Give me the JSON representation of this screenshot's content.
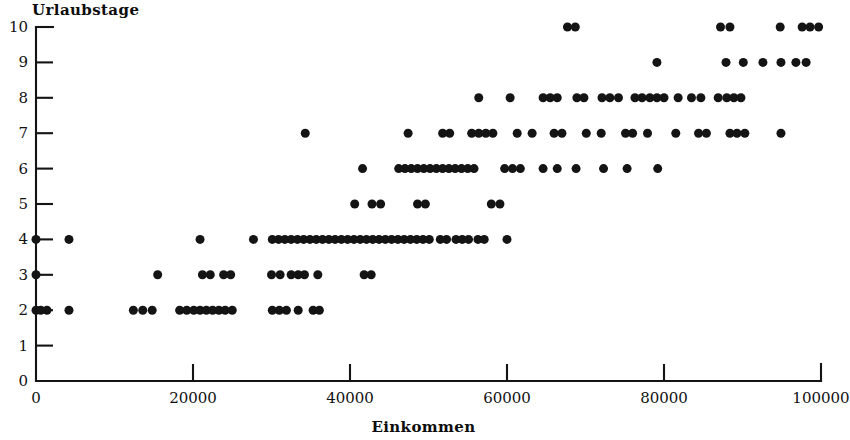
{
  "chart_data": {
    "type": "scatter",
    "title": "",
    "xlabel": "Einkommen",
    "ylabel": "Urlaubstage",
    "xlim": [
      0,
      100000
    ],
    "ylim": [
      0,
      10
    ],
    "grid": false,
    "legend": null,
    "marker": {
      "shape": "circle",
      "color": "#141414",
      "size_px": 9
    },
    "xticks": [
      0,
      20000,
      40000,
      60000,
      80000,
      100000
    ],
    "xtick_labels": [
      "0",
      "20000",
      "40000",
      "60000",
      "80000",
      "100000"
    ],
    "yticks": [
      0,
      1,
      2,
      3,
      4,
      5,
      6,
      7,
      8,
      9,
      10
    ],
    "ytick_labels": [
      "0",
      "1",
      "2",
      "3",
      "4",
      "5",
      "6",
      "7",
      "8",
      "9",
      "10"
    ],
    "series": [
      {
        "name": "Beobachtungen",
        "points": [
          [
            0,
            2
          ],
          [
            600,
            2
          ],
          [
            1400,
            2
          ],
          [
            4200,
            2
          ],
          [
            12400,
            2
          ],
          [
            13600,
            2
          ],
          [
            14800,
            2
          ],
          [
            18300,
            2
          ],
          [
            19200,
            2
          ],
          [
            20100,
            2
          ],
          [
            20900,
            2
          ],
          [
            21700,
            2
          ],
          [
            22500,
            2
          ],
          [
            23300,
            2
          ],
          [
            24100,
            2
          ],
          [
            25000,
            2
          ],
          [
            30100,
            2
          ],
          [
            31000,
            2
          ],
          [
            31900,
            2
          ],
          [
            33400,
            2
          ],
          [
            35300,
            2
          ],
          [
            36100,
            2
          ],
          [
            0,
            3
          ],
          [
            15500,
            3
          ],
          [
            21200,
            3
          ],
          [
            22200,
            3
          ],
          [
            23900,
            3
          ],
          [
            24800,
            3
          ],
          [
            30000,
            3
          ],
          [
            31100,
            3
          ],
          [
            32500,
            3
          ],
          [
            33400,
            3
          ],
          [
            34200,
            3
          ],
          [
            35900,
            3
          ],
          [
            41800,
            3
          ],
          [
            42700,
            3
          ],
          [
            0,
            4
          ],
          [
            4200,
            4
          ],
          [
            20900,
            4
          ],
          [
            27700,
            4
          ],
          [
            30100,
            4
          ],
          [
            30900,
            4
          ],
          [
            31700,
            4
          ],
          [
            32500,
            4
          ],
          [
            33300,
            4
          ],
          [
            34100,
            4
          ],
          [
            34900,
            4
          ],
          [
            35700,
            4
          ],
          [
            36500,
            4
          ],
          [
            37300,
            4
          ],
          [
            38100,
            4
          ],
          [
            38900,
            4
          ],
          [
            39700,
            4
          ],
          [
            40500,
            4
          ],
          [
            41300,
            4
          ],
          [
            42100,
            4
          ],
          [
            42900,
            4
          ],
          [
            43700,
            4
          ],
          [
            44500,
            4
          ],
          [
            45300,
            4
          ],
          [
            46100,
            4
          ],
          [
            46900,
            4
          ],
          [
            47700,
            4
          ],
          [
            48500,
            4
          ],
          [
            49300,
            4
          ],
          [
            50100,
            4
          ],
          [
            51500,
            4
          ],
          [
            52300,
            4
          ],
          [
            53500,
            4
          ],
          [
            54300,
            4
          ],
          [
            55100,
            4
          ],
          [
            56300,
            4
          ],
          [
            57100,
            4
          ],
          [
            60000,
            4
          ],
          [
            40600,
            5
          ],
          [
            42800,
            5
          ],
          [
            43900,
            5
          ],
          [
            48600,
            5
          ],
          [
            49600,
            5
          ],
          [
            58000,
            5
          ],
          [
            59100,
            5
          ],
          [
            41600,
            6
          ],
          [
            46200,
            6
          ],
          [
            47000,
            6
          ],
          [
            47800,
            6
          ],
          [
            48600,
            6
          ],
          [
            49400,
            6
          ],
          [
            50200,
            6
          ],
          [
            51000,
            6
          ],
          [
            51800,
            6
          ],
          [
            52600,
            6
          ],
          [
            53400,
            6
          ],
          [
            54200,
            6
          ],
          [
            55000,
            6
          ],
          [
            55800,
            6
          ],
          [
            59700,
            6
          ],
          [
            60700,
            6
          ],
          [
            61700,
            6
          ],
          [
            64600,
            6
          ],
          [
            66400,
            6
          ],
          [
            68800,
            6
          ],
          [
            72300,
            6
          ],
          [
            75300,
            6
          ],
          [
            79200,
            6
          ],
          [
            34300,
            7
          ],
          [
            47400,
            7
          ],
          [
            51800,
            7
          ],
          [
            52700,
            7
          ],
          [
            55500,
            7
          ],
          [
            56400,
            7
          ],
          [
            57300,
            7
          ],
          [
            58200,
            7
          ],
          [
            61300,
            7
          ],
          [
            63200,
            7
          ],
          [
            66000,
            7
          ],
          [
            67000,
            7
          ],
          [
            70100,
            7
          ],
          [
            72000,
            7
          ],
          [
            75100,
            7
          ],
          [
            76000,
            7
          ],
          [
            77900,
            7
          ],
          [
            81500,
            7
          ],
          [
            84400,
            7
          ],
          [
            85400,
            7
          ],
          [
            88400,
            7
          ],
          [
            89300,
            7
          ],
          [
            90300,
            7
          ],
          [
            94900,
            7
          ],
          [
            56400,
            8
          ],
          [
            60400,
            8
          ],
          [
            64600,
            8
          ],
          [
            65500,
            8
          ],
          [
            66400,
            8
          ],
          [
            68900,
            8
          ],
          [
            69800,
            8
          ],
          [
            72100,
            8
          ],
          [
            73100,
            8
          ],
          [
            74200,
            8
          ],
          [
            76300,
            8
          ],
          [
            77200,
            8
          ],
          [
            78200,
            8
          ],
          [
            79100,
            8
          ],
          [
            80000,
            8
          ],
          [
            81800,
            8
          ],
          [
            83500,
            8
          ],
          [
            84700,
            8
          ],
          [
            86900,
            8
          ],
          [
            88000,
            8
          ],
          [
            88900,
            8
          ],
          [
            89800,
            8
          ],
          [
            79100,
            9
          ],
          [
            87900,
            9
          ],
          [
            90100,
            9
          ],
          [
            92600,
            9
          ],
          [
            94900,
            9
          ],
          [
            96800,
            9
          ],
          [
            98100,
            9
          ],
          [
            67700,
            10
          ],
          [
            68700,
            10
          ],
          [
            87200,
            10
          ],
          [
            88400,
            10
          ],
          [
            94800,
            10
          ],
          [
            97600,
            10
          ],
          [
            98600,
            10
          ],
          [
            99700,
            10
          ]
        ]
      }
    ]
  },
  "axes": {
    "y_title": "Urlaubstage",
    "x_title": "Einkommen"
  }
}
